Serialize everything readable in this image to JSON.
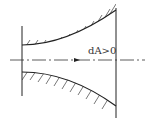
{
  "diagram": {
    "label": "dA>0"
  }
}
